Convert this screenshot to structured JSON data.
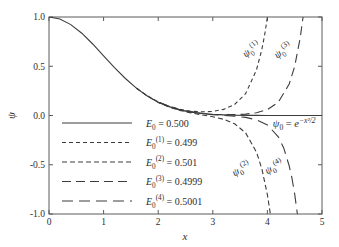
{
  "figure": {
    "background": "#ffffff",
    "frame_color": "#5a5a5a",
    "line_color": "#3c3c3c",
    "text_color": "#2e2e2e"
  },
  "chart_data": {
    "type": "line",
    "title": "",
    "xlabel": "x",
    "ylabel": "ψ",
    "xlim": [
      0,
      5
    ],
    "ylim": [
      -1.0,
      1.0
    ],
    "xticks": [
      "0",
      "1",
      "2",
      "3",
      "4",
      "5"
    ],
    "yticks": [
      "-1.0",
      "-0.5",
      "0.0",
      "0.5",
      "1.0"
    ],
    "grid": false,
    "legend_position": "lower-left-inside",
    "series": [
      {
        "name": "E0 = 0.500",
        "energy": 0.5,
        "dash": [],
        "label_segments": [
          {
            "t": "E",
            "i": true
          },
          {
            "t": "0",
            "pos": "sub"
          },
          {
            "t": " = 0.500"
          }
        ],
        "points": [
          [
            0,
            1.0
          ],
          [
            0.2,
            0.9802
          ],
          [
            0.4,
            0.9231
          ],
          [
            0.6,
            0.8353
          ],
          [
            0.8,
            0.7261
          ],
          [
            1.0,
            0.6065
          ],
          [
            1.2,
            0.4868
          ],
          [
            1.4,
            0.3753
          ],
          [
            1.6,
            0.278
          ],
          [
            1.8,
            0.1979
          ],
          [
            2.0,
            0.1353
          ],
          [
            2.2,
            0.0889
          ],
          [
            2.4,
            0.0561
          ],
          [
            2.6,
            0.034
          ],
          [
            2.8,
            0.0198
          ],
          [
            3.0,
            0.0111
          ],
          [
            3.2,
            0.006
          ],
          [
            3.4,
            0.0031
          ],
          [
            3.6,
            0.0015
          ],
          [
            3.8,
            0.0007
          ],
          [
            4.0,
            0.0003
          ],
          [
            4.2,
            0.0001
          ],
          [
            4.4,
            0.0001
          ],
          [
            4.6,
            0.0
          ],
          [
            4.8,
            0.0
          ],
          [
            5.0,
            0.0
          ]
        ]
      },
      {
        "name": "E0(1) = 0.499",
        "energy": 0.499,
        "dash": [
          4,
          3
        ],
        "label_segments": [
          {
            "t": "E",
            "i": true
          },
          {
            "t": "0",
            "pos": "sub"
          },
          {
            "t": "(1)",
            "pos": "sup"
          },
          {
            "t": " = 0.499"
          }
        ],
        "points": [
          [
            1.6,
            0.2792
          ],
          [
            1.8,
            0.1996
          ],
          [
            2.0,
            0.1378
          ],
          [
            2.2,
            0.0927
          ],
          [
            2.4,
            0.0621
          ],
          [
            2.6,
            0.0438
          ],
          [
            2.8,
            0.0367
          ],
          [
            3.0,
            0.0413
          ],
          [
            3.2,
            0.0616
          ],
          [
            3.4,
            0.1116
          ],
          [
            3.6,
            0.2213
          ],
          [
            3.8,
            0.4633
          ],
          [
            3.9,
            0.6735
          ],
          [
            3.95,
            0.82
          ],
          [
            4.0,
            0.9992
          ],
          [
            4.05,
            1.22
          ]
        ]
      },
      {
        "name": "E0(2) = 0.501",
        "energy": 0.501,
        "dash": [
          5,
          3
        ],
        "label_segments": [
          {
            "t": "E",
            "i": true
          },
          {
            "t": "0",
            "pos": "sub"
          },
          {
            "t": "(2)",
            "pos": "sup"
          },
          {
            "t": " = 0.501"
          }
        ],
        "points": [
          [
            1.6,
            0.277
          ],
          [
            1.8,
            0.1965
          ],
          [
            2.0,
            0.1333
          ],
          [
            2.2,
            0.0859
          ],
          [
            2.4,
            0.0513
          ],
          [
            2.6,
            0.0261
          ],
          [
            2.8,
            0.0062
          ],
          [
            3.0,
            -0.0132
          ],
          [
            3.2,
            -0.0388
          ],
          [
            3.4,
            -0.0843
          ],
          [
            3.6,
            -0.1757
          ],
          [
            3.8,
            -0.3722
          ],
          [
            3.9,
            -0.5424
          ],
          [
            4.0,
            -0.8046
          ],
          [
            4.05,
            -0.983
          ],
          [
            4.09,
            -1.21
          ]
        ]
      },
      {
        "name": "E0(3) = 0.4999",
        "energy": 0.4999,
        "dash": [
          9,
          5
        ],
        "label_segments": [
          {
            "t": "E",
            "i": true
          },
          {
            "t": "0",
            "pos": "sub"
          },
          {
            "t": "(3)",
            "pos": "sup"
          },
          {
            "t": " = 0.4999"
          }
        ],
        "points": [
          [
            2.0,
            0.1354
          ],
          [
            2.4,
            0.0565
          ],
          [
            2.8,
            0.0208
          ],
          [
            3.0,
            0.0129
          ],
          [
            3.2,
            0.0093
          ],
          [
            3.4,
            0.0096
          ],
          [
            3.6,
            0.0146
          ],
          [
            3.8,
            0.0283
          ],
          [
            4.0,
            0.0599
          ],
          [
            4.2,
            0.1355
          ],
          [
            4.4,
            0.3201
          ],
          [
            4.5,
            0.4992
          ],
          [
            4.6,
            0.7881
          ],
          [
            4.65,
            0.988
          ],
          [
            4.7,
            1.25
          ]
        ]
      },
      {
        "name": "E0(4) = 0.5001",
        "energy": 0.5001,
        "dash": [
          11,
          6
        ],
        "label_segments": [
          {
            "t": "E",
            "i": true
          },
          {
            "t": "0",
            "pos": "sub"
          },
          {
            "t": "(4)",
            "pos": "sup"
          },
          {
            "t": " = 0.5001"
          }
        ],
        "points": [
          [
            2.0,
            0.1351
          ],
          [
            2.4,
            0.0555
          ],
          [
            2.8,
            0.0182
          ],
          [
            3.0,
            0.0082
          ],
          [
            3.2,
            0.0007
          ],
          [
            3.4,
            -0.0073
          ],
          [
            3.6,
            -0.0195
          ],
          [
            3.8,
            -0.0435
          ],
          [
            4.0,
            -0.0951
          ],
          [
            4.2,
            -0.2165
          ],
          [
            4.3,
            -0.332
          ],
          [
            4.4,
            -0.512
          ],
          [
            4.45,
            -0.638
          ],
          [
            4.5,
            -0.7987
          ],
          [
            4.55,
            -1.0
          ],
          [
            4.58,
            -1.25
          ]
        ]
      }
    ],
    "annotations": [
      {
        "name": "psi0-1-label",
        "text": "ψ0(1)",
        "x": 3.74,
        "y": 0.645,
        "rot": -38,
        "anchor": "middle",
        "segments": [
          {
            "t": "ψ",
            "i": true
          },
          {
            "t": "0",
            "pos": "sub"
          },
          {
            "t": "(1)",
            "pos": "sup"
          }
        ]
      },
      {
        "name": "psi0-3-label",
        "text": "ψ0(3)",
        "x": 4.32,
        "y": 0.635,
        "rot": -38,
        "anchor": "middle",
        "segments": [
          {
            "t": "ψ",
            "i": true
          },
          {
            "t": "0",
            "pos": "sub"
          },
          {
            "t": "(3)",
            "pos": "sup"
          }
        ]
      },
      {
        "name": "psi0-2-label",
        "text": "ψ0(2)",
        "x": 3.55,
        "y": -0.57,
        "rot": -30,
        "anchor": "middle",
        "segments": [
          {
            "t": "ψ",
            "i": true
          },
          {
            "t": "0",
            "pos": "sub"
          },
          {
            "t": "(2)",
            "pos": "sup"
          }
        ]
      },
      {
        "name": "psi0-4-label",
        "text": "ψ0(4)",
        "x": 4.15,
        "y": -0.55,
        "rot": -30,
        "anchor": "middle",
        "segments": [
          {
            "t": "ψ",
            "i": true
          },
          {
            "t": "0",
            "pos": "sub"
          },
          {
            "t": "(4)",
            "pos": "sup"
          }
        ]
      },
      {
        "name": "psi0-exact-label",
        "text": "ψ0 = e−x²/2",
        "x": 4.1,
        "y": -0.12,
        "rot": 0,
        "anchor": "start",
        "segments": [
          {
            "t": "ψ",
            "i": true
          },
          {
            "t": "0",
            "pos": "sub"
          },
          {
            "t": " = "
          },
          {
            "t": "e",
            "i": true
          },
          {
            "t": "−x²/2",
            "pos": "sup",
            "i": true
          }
        ]
      }
    ]
  }
}
